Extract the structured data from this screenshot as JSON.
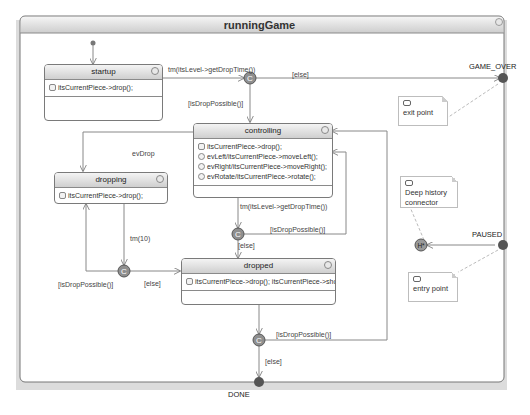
{
  "diagram": {
    "type": "statechart",
    "title": "runningGame",
    "colors": {
      "state_header_top": "#f4f4f4",
      "state_header_bottom": "#cfcfcf",
      "border": "#7a7a7a",
      "connector_fill": "#8f8f8f",
      "point_fill": "#555555",
      "outer_shadow": "#d6d6d6"
    },
    "states": [
      {
        "id": "startup",
        "name": "startup",
        "actions": [
          "itsCurrentPiece->drop();"
        ]
      },
      {
        "id": "controlling",
        "name": "controlling",
        "actions": [
          "itsCurrentPiece->drop();",
          "evLeft/itsCurrentPiece->moveLeft();",
          "evRight/itsCurrentPiece->moveRight();",
          "evRotate/itsCurrentPiece->rotate();"
        ]
      },
      {
        "id": "dropping",
        "name": "dropping",
        "actions": [
          "itsCurrentPiece->drop();"
        ]
      },
      {
        "id": "dropped",
        "name": "dropped",
        "actions": [
          "itsCurrentPiece->drop(); itsCurrentPiece->show();"
        ]
      }
    ],
    "connectors": [
      {
        "id": "c1",
        "glyph": "C"
      },
      {
        "id": "c2",
        "glyph": "C"
      },
      {
        "id": "c3",
        "glyph": "C"
      },
      {
        "id": "c4",
        "glyph": "C"
      },
      {
        "id": "history",
        "glyph": "H*"
      }
    ],
    "points": {
      "game_over": "GAME_OVER",
      "paused": "PAUSED",
      "done": "DONE"
    },
    "transitions": {
      "startup_to_c1": "tm(itsLevel->getDropTime())",
      "c1_else": "[else]",
      "c1_drop_possible": "[isDropPossible()]",
      "ev_drop": "evDrop",
      "controlling_tm": "tm(itsLevel->getDropTime())",
      "c2_drop_possible": "[isDropPossible()]",
      "c2_else": "[else]",
      "dropping_tm": "tm(10)",
      "c3_drop_possible": "[isDropPossible()]",
      "c3_else": "[else]",
      "c4_drop_possible": "[isDropPossible()]",
      "c4_else": "[else]"
    },
    "notes": {
      "exit_point": "exit point",
      "deep_history": "Deep history connector",
      "entry_point": "entry point"
    }
  }
}
